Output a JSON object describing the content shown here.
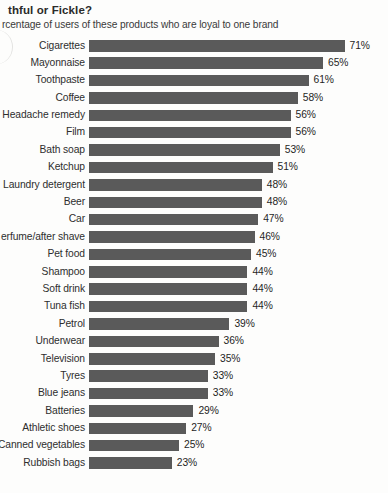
{
  "header": {
    "title": "thful or Fickle?",
    "subtitle": "rcentage of users of these products who are loyal to one brand"
  },
  "style": {
    "bar_color": "#5a5a5a",
    "background_color": "#fdfdfc",
    "text_color": "#2e2e2e"
  },
  "chart_data": {
    "type": "bar",
    "orientation": "horizontal",
    "title": "thful or Fickle?",
    "subtitle": "rcentage of users of these products who are loyal to one brand",
    "xlabel": "",
    "ylabel": "",
    "xlim": [
      0,
      71
    ],
    "grid": false,
    "legend": false,
    "value_suffix": "%",
    "categories": [
      "Cigarettes",
      "Mayonnaise",
      "Toothpaste",
      "Coffee",
      "Headache remedy",
      "Film",
      "Bath soap",
      "Ketchup",
      "Laundry detergent",
      "Beer",
      "Car",
      "erfume/after shave",
      "Pet food",
      "Shampoo",
      "Soft drink",
      "Tuna fish",
      "Petrol",
      "Underwear",
      "Television",
      "Tyres",
      "Blue jeans",
      "Batteries",
      "Athletic shoes",
      "Canned vegetables",
      "Rubbish bags"
    ],
    "values": [
      71,
      65,
      61,
      58,
      56,
      56,
      53,
      51,
      48,
      48,
      47,
      46,
      45,
      44,
      44,
      44,
      39,
      36,
      35,
      33,
      33,
      29,
      27,
      25,
      23
    ],
    "value_labels": [
      "71%",
      "65%",
      "61%",
      "58%",
      "56%",
      "56%",
      "53%",
      "51%",
      "48%",
      "48%",
      "47%",
      "46%",
      "45%",
      "44%",
      "44%",
      "44%",
      "39%",
      "36%",
      "35%",
      "33%",
      "33%",
      "29%",
      "27%",
      "25%",
      "23%"
    ],
    "rows": [
      {
        "label": "Cigarettes",
        "value": 71,
        "value_label": "71%"
      },
      {
        "label": "Mayonnaise",
        "value": 65,
        "value_label": "65%"
      },
      {
        "label": "Toothpaste",
        "value": 61,
        "value_label": "61%"
      },
      {
        "label": "Coffee",
        "value": 58,
        "value_label": "58%"
      },
      {
        "label": "Headache remedy",
        "value": 56,
        "value_label": "56%"
      },
      {
        "label": "Film",
        "value": 56,
        "value_label": "56%"
      },
      {
        "label": "Bath soap",
        "value": 53,
        "value_label": "53%"
      },
      {
        "label": "Ketchup",
        "value": 51,
        "value_label": "51%"
      },
      {
        "label": "Laundry detergent",
        "value": 48,
        "value_label": "48%"
      },
      {
        "label": "Beer",
        "value": 48,
        "value_label": "48%"
      },
      {
        "label": "Car",
        "value": 47,
        "value_label": "47%"
      },
      {
        "label": "erfume/after shave",
        "value": 46,
        "value_label": "46%"
      },
      {
        "label": "Pet food",
        "value": 45,
        "value_label": "45%"
      },
      {
        "label": "Shampoo",
        "value": 44,
        "value_label": "44%"
      },
      {
        "label": "Soft drink",
        "value": 44,
        "value_label": "44%"
      },
      {
        "label": "Tuna fish",
        "value": 44,
        "value_label": "44%"
      },
      {
        "label": "Petrol",
        "value": 39,
        "value_label": "39%"
      },
      {
        "label": "Underwear",
        "value": 36,
        "value_label": "36%"
      },
      {
        "label": "Television",
        "value": 35,
        "value_label": "35%"
      },
      {
        "label": "Tyres",
        "value": 33,
        "value_label": "33%"
      },
      {
        "label": "Blue jeans",
        "value": 33,
        "value_label": "33%"
      },
      {
        "label": "Batteries",
        "value": 29,
        "value_label": "29%"
      },
      {
        "label": "Athletic shoes",
        "value": 27,
        "value_label": "27%"
      },
      {
        "label": "Canned vegetables",
        "value": 25,
        "value_label": "25%"
      },
      {
        "label": "Rubbish bags",
        "value": 23,
        "value_label": "23%"
      }
    ]
  }
}
